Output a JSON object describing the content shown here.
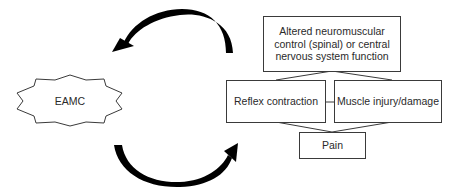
{
  "diagram": {
    "title": "",
    "nodes": {
      "eamc": {
        "label": "EAMC",
        "shape": "star"
      },
      "altered_control": {
        "label": "Altered neuromuscular control (spinal) or central nervous system function",
        "lines": [
          "Altered neuromuscular",
          "control (spinal) or central",
          "nervous system function"
        ]
      },
      "reflex_contraction": {
        "label": "Reflex contraction"
      },
      "muscle_injury": {
        "label": "Muscle injury/damage"
      },
      "pain": {
        "label": "Pain"
      }
    },
    "edges": [
      {
        "from": "altered_control",
        "to": "eamc",
        "style": "curved-arrow"
      },
      {
        "from": "eamc",
        "to": "reflex_contraction",
        "style": "curved-arrow"
      },
      {
        "from": "altered_control",
        "to": "reflex_contraction",
        "style": "line"
      },
      {
        "from": "altered_control",
        "to": "muscle_injury",
        "style": "line"
      },
      {
        "from": "reflex_contraction",
        "to": "muscle_injury",
        "style": "line"
      },
      {
        "from": "reflex_contraction",
        "to": "pain",
        "style": "line"
      },
      {
        "from": "muscle_injury",
        "to": "pain",
        "style": "line"
      }
    ],
    "colors": {
      "stroke": "#3a3a3a",
      "arrow": "#000000",
      "text": "#2a2a2a",
      "background": "#ffffff"
    }
  }
}
